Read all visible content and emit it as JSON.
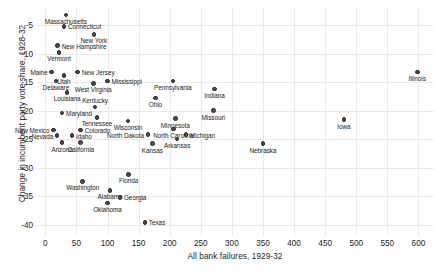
{
  "chart_data": {
    "type": "scatter",
    "title": "",
    "xlabel": "All bank failures, 1929-32",
    "ylabel": "Change in incumbent party vote share, 1928-32",
    "xlim": [
      -15,
      625
    ],
    "ylim": [
      -42,
      -2
    ],
    "xticks": [
      0,
      50,
      100,
      150,
      200,
      250,
      300,
      350,
      400,
      450,
      500,
      550,
      600
    ],
    "yticks": [
      -5,
      -10,
      -15,
      -20,
      -25,
      -30,
      -35,
      -40
    ],
    "grid": true,
    "legend": "none",
    "point_color": "#4d4d4d",
    "points": [
      {
        "label": "Massachusetts",
        "x": 33,
        "y": -3.2,
        "pos": "b"
      },
      {
        "label": "Connecticut",
        "x": 30,
        "y": -5.2,
        "pos": "r"
      },
      {
        "label": "New Hampshire",
        "x": 20,
        "y": -8.6,
        "pos": "r"
      },
      {
        "label": "New York",
        "x": 78,
        "y": -6.6,
        "pos": "b"
      },
      {
        "label": "Vermont",
        "x": 22,
        "y": -9.8,
        "pos": "b"
      },
      {
        "label": "Maine",
        "x": 10,
        "y": -13.2,
        "pos": "l"
      },
      {
        "label": "Utah",
        "x": 30,
        "y": -13.8,
        "pos": "b"
      },
      {
        "label": "New Jersey",
        "x": 52,
        "y": -13.2,
        "pos": "r"
      },
      {
        "label": "Delaware",
        "x": 17,
        "y": -14.8,
        "pos": "b"
      },
      {
        "label": "West Virginia",
        "x": 77,
        "y": -15.2,
        "pos": "b"
      },
      {
        "label": "Mississippi",
        "x": 100,
        "y": -14.8,
        "pos": "r"
      },
      {
        "label": "Pennsylvania",
        "x": 205,
        "y": -14.8,
        "pos": "b"
      },
      {
        "label": "Louisiana",
        "x": 35,
        "y": -16.8,
        "pos": "b"
      },
      {
        "label": "Indiana",
        "x": 272,
        "y": -16.2,
        "pos": "b"
      },
      {
        "label": "Illinois",
        "x": 598,
        "y": -13.2,
        "pos": "b"
      },
      {
        "label": "Ohio",
        "x": 177,
        "y": -17.8,
        "pos": "b"
      },
      {
        "label": "Kentucky",
        "x": 80,
        "y": -19.4,
        "pos": "t"
      },
      {
        "label": "Maryland",
        "x": 27,
        "y": -20.4,
        "pos": "r"
      },
      {
        "label": "Tennessee",
        "x": 83,
        "y": -21.2,
        "pos": "b"
      },
      {
        "label": "Wisconsin",
        "x": 133,
        "y": -21.8,
        "pos": "b"
      },
      {
        "label": "Minnesota",
        "x": 209,
        "y": -21.4,
        "pos": "b"
      },
      {
        "label": "Missouri",
        "x": 270,
        "y": -20.0,
        "pos": "b"
      },
      {
        "label": "Iowa",
        "x": 480,
        "y": -21.6,
        "pos": "b"
      },
      {
        "label": "New Mexico",
        "x": 13,
        "y": -23.4,
        "pos": "l"
      },
      {
        "label": "Colorado",
        "x": 57,
        "y": -23.4,
        "pos": "r"
      },
      {
        "label": "North Carolina",
        "x": 206,
        "y": -23.2,
        "pos": "b"
      },
      {
        "label": "Michigan",
        "x": 226,
        "y": -24.2,
        "pos": "r"
      },
      {
        "label": "Nevada",
        "x": 19,
        "y": -24.4,
        "pos": "l"
      },
      {
        "label": "Idaho",
        "x": 43,
        "y": -24.4,
        "pos": "r"
      },
      {
        "label": "North Dakota",
        "x": 165,
        "y": -24.2,
        "pos": "l"
      },
      {
        "label": "Arkansas",
        "x": 212,
        "y": -25.0,
        "pos": "b"
      },
      {
        "label": "Arizona",
        "x": 27,
        "y": -25.6,
        "pos": "b"
      },
      {
        "label": "California",
        "x": 57,
        "y": -25.6,
        "pos": "b"
      },
      {
        "label": "Kansas",
        "x": 172,
        "y": -25.8,
        "pos": "b"
      },
      {
        "label": "Nebraska",
        "x": 350,
        "y": -25.8,
        "pos": "b"
      },
      {
        "label": "Florida",
        "x": 134,
        "y": -31.2,
        "pos": "b"
      },
      {
        "label": "Washington",
        "x": 60,
        "y": -32.4,
        "pos": "b"
      },
      {
        "label": "Alabama",
        "x": 104,
        "y": -34.0,
        "pos": "b"
      },
      {
        "label": "Georgia",
        "x": 120,
        "y": -35.2,
        "pos": "r"
      },
      {
        "label": "Oklahoma",
        "x": 100,
        "y": -36.2,
        "pos": "b"
      },
      {
        "label": "Texas",
        "x": 160,
        "y": -39.6,
        "pos": "r"
      }
    ]
  }
}
